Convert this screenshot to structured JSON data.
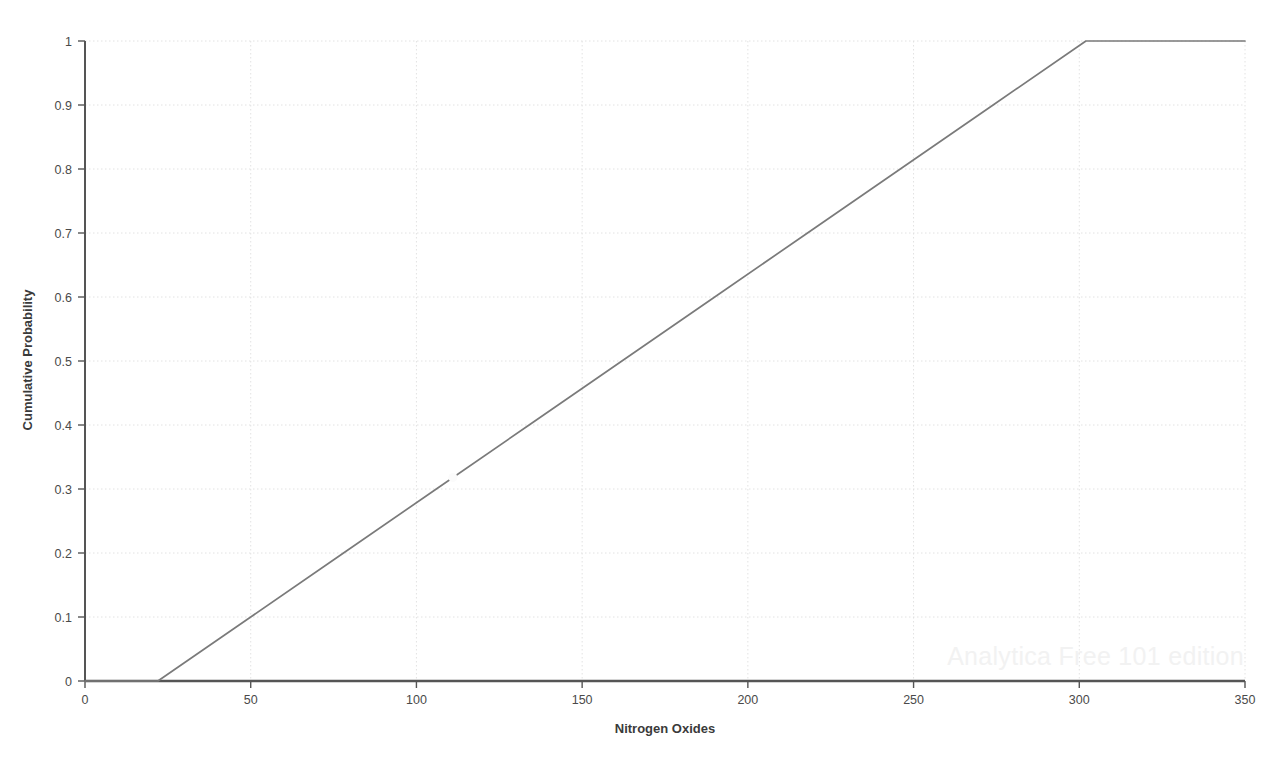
{
  "chart_data": {
    "type": "line",
    "title": "",
    "subtitle": "",
    "xlabel": "Nitrogen Oxides",
    "ylabel": "Cumulative Probability",
    "xlim": [
      0,
      350
    ],
    "ylim": [
      0,
      1
    ],
    "grid": true,
    "legend": null,
    "legend_position": "none",
    "xticks": [
      0,
      50,
      100,
      150,
      200,
      250,
      300,
      350
    ],
    "xtick_labels": [
      "0",
      "50",
      "100",
      "150",
      "200",
      "250",
      "300",
      "350"
    ],
    "yticks": [
      0,
      0.1,
      0.2,
      0.3,
      0.4,
      0.5,
      0.6,
      0.7,
      0.8,
      0.9,
      1
    ],
    "ytick_labels": [
      "0",
      "0.1",
      "0.2",
      "0.3",
      "0.4",
      "0.5",
      "0.6",
      "0.7",
      "0.8",
      "0.9",
      "1"
    ],
    "series": [
      {
        "name": "Cumulative Probability",
        "color": "#7a7a7a",
        "x": [
          0,
          22,
          50,
          78,
          106,
          134,
          162,
          190,
          218,
          246,
          274,
          302,
          350
        ],
        "y": [
          0,
          0,
          0.1,
          0.2,
          0.3,
          0.4,
          0.5,
          0.6,
          0.7,
          0.8,
          0.9,
          1,
          1
        ]
      }
    ],
    "annotations": [
      {
        "name": "line-artifact-marker",
        "x": 111,
        "y": 0.318,
        "note": "small rendering gap / light marker on the curve"
      }
    ]
  },
  "axes": {
    "x_axis_label": "Nitrogen Oxides",
    "y_axis_label": "Cumulative Probability",
    "axis_color": "#555555",
    "grid_color": "#e2e2e2",
    "line_color": "#7a7a7a",
    "background_color": "#ffffff"
  },
  "watermark": {
    "text": "Analytica Free 101 edition",
    "color": "#f2f2f2"
  }
}
